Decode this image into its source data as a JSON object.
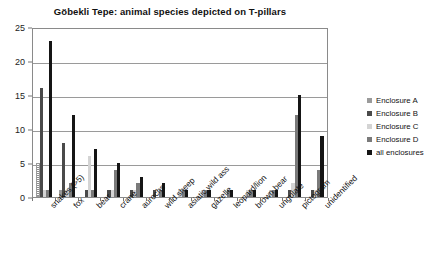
{
  "chart_data": {
    "type": "bar",
    "title": "Göbekli Tepe: animal species depicted on T-pillars",
    "xlabel": "",
    "ylabel": "",
    "ylim": [
      0,
      25
    ],
    "yticks": [
      0,
      5,
      10,
      15,
      20,
      25
    ],
    "grid": true,
    "legend_position": "right",
    "categories": [
      "snakes (>5)",
      "fox",
      "bear",
      "crane",
      "aurochs",
      "wild sheep",
      "asiatic wild ass",
      "gazelle",
      "leopard/lion",
      "brown bear",
      "ungulate",
      "pictogram",
      "unidentified"
    ],
    "series": [
      {
        "name": "Enclosure A",
        "color": "#9b9b9b",
        "values": [
          5,
          1,
          0,
          0,
          0,
          0,
          0,
          0,
          0,
          0,
          0,
          0,
          0
        ]
      },
      {
        "name": "Enclosure B",
        "color": "#4a4a4a",
        "values": [
          16,
          8,
          1,
          1,
          1,
          1,
          0,
          0,
          0,
          0,
          0,
          1,
          1
        ]
      },
      {
        "name": "Enclosure C",
        "color": "#d4d4d4",
        "values": [
          1,
          1,
          6,
          1,
          1,
          0,
          1,
          1,
          0,
          1,
          1,
          2,
          1
        ]
      },
      {
        "name": "Enclosure D",
        "color": "#7a7a7a",
        "values": [
          1,
          2,
          1,
          4,
          2,
          1,
          1,
          1,
          1,
          1,
          1,
          12,
          4
        ]
      },
      {
        "name": "all enclosures",
        "color": "#151515",
        "values": [
          23,
          12,
          7,
          5,
          3,
          2,
          1,
          1,
          1,
          1,
          1,
          15,
          9
        ]
      }
    ]
  },
  "legend": {
    "items": [
      {
        "label": "Enclosure A"
      },
      {
        "label": "Enclosure B"
      },
      {
        "label": "Enclosure C"
      },
      {
        "label": "Enclosure D"
      },
      {
        "label": "all enclosures"
      }
    ]
  }
}
